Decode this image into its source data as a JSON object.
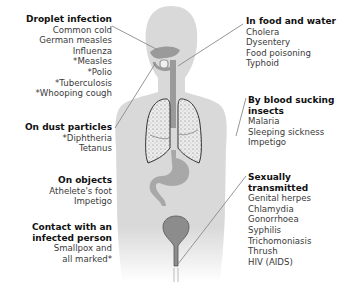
{
  "diagram": {
    "colors": {
      "body": "#d9d9d9",
      "organ": "#9a9a9a",
      "lung_fill": "#e6e6e6",
      "leader_line": "#8a8a8a",
      "bladder": "#8c8c8c"
    },
    "left_groups": [
      {
        "title": "Droplet infection",
        "items": [
          "Common cold",
          "German measles",
          "Influenza",
          "*Measles",
          "*Polio",
          "*Tuberculosis",
          "*Whooping cough"
        ]
      },
      {
        "title": "On dust particles",
        "items": [
          "*Diphtheria",
          "Tetanus"
        ]
      },
      {
        "title": "On objects",
        "items": [
          "Athelete's foot",
          "Impetigo"
        ]
      },
      {
        "title": "Contact with an infected person",
        "title_lines": [
          "Contact with an",
          "infected person"
        ],
        "items": [
          "Smallpox and",
          "all marked*"
        ]
      }
    ],
    "right_groups": [
      {
        "title": "In food and water",
        "items": [
          "Cholera",
          "Dysentery",
          "Food poisoning",
          "Typhoid"
        ]
      },
      {
        "title": "By blood sucking insects",
        "title_lines": [
          "By blood sucking",
          "insects"
        ],
        "items": [
          "Malaria",
          "Sleeping sickness",
          "Impetigo"
        ]
      },
      {
        "title": "Sexually transmitted",
        "title_lines": [
          "Sexually",
          "transmitted"
        ],
        "items": [
          "Genital herpes",
          "Chlamydia",
          "Gonorrhoea",
          "Syphilis",
          "Trichomoniasis",
          "Thrush",
          "HIV (AIDS)"
        ]
      }
    ]
  }
}
